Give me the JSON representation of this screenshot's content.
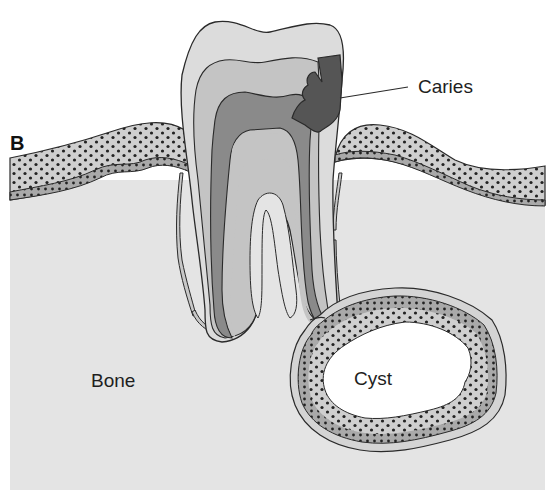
{
  "figure": {
    "panel_letter": "B",
    "labels": {
      "caries": "Caries",
      "bone": "Bone",
      "cyst": "Cyst"
    },
    "colors": {
      "background": "#ffffff",
      "bone": "#e4e4e4",
      "gum": "#cfcfcf",
      "gum_dots": "#222222",
      "enamel": "#dcdcdc",
      "dentin": "#b9b9b9",
      "pulp": "#8a8a8a",
      "caries": "#555555",
      "cyst_lumen": "#ffffff",
      "outline": "#2a2a2a"
    }
  }
}
